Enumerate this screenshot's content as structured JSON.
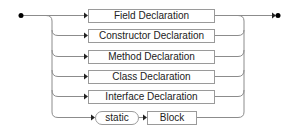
{
  "diagram": {
    "type": "railroad",
    "alternatives": [
      {
        "label": "Field Declaration"
      },
      {
        "label": "Constructor Declaration"
      },
      {
        "label": "Method Declaration"
      },
      {
        "label": "Class Declaration"
      },
      {
        "label": "Interface Declaration"
      },
      {
        "sequence": [
          {
            "label": "static",
            "kind": "terminal"
          },
          {
            "label": "Block",
            "kind": "nonterminal"
          }
        ]
      }
    ],
    "colors": {
      "line": "#9a9a9a",
      "text": "#222222",
      "terminator": "#000000"
    }
  }
}
